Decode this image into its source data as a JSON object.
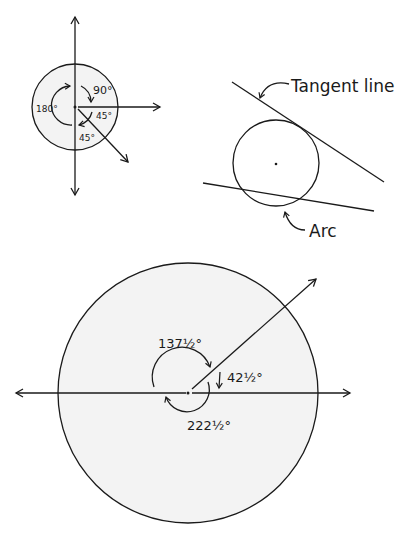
{
  "diagram": {
    "angles_figure": {
      "labels": {
        "a90": "90°",
        "a180": "180°",
        "a45_right": "45°",
        "a45_below": "45°"
      }
    },
    "tangent_figure": {
      "labels": {
        "tangent": "Tangent line",
        "arc": "Arc"
      }
    },
    "large_circle_figure": {
      "labels": {
        "a137": "137½°",
        "a42": "42½°",
        "a222": "222½°"
      }
    }
  }
}
